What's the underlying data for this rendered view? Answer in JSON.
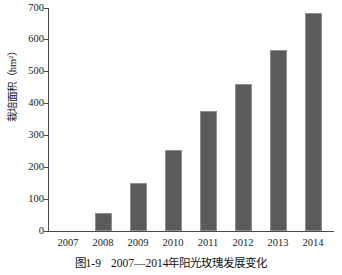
{
  "figure": {
    "caption_number": "图1-9",
    "caption_text": "2007—2014年阳光玫瑰发展变化"
  },
  "chart_data": {
    "type": "bar",
    "title": "",
    "subtitle": "",
    "xlabel": "年",
    "ylabel": "栽培面积（hm²）",
    "categories": [
      "2007",
      "2008",
      "2009",
      "2010",
      "2011",
      "2012",
      "2013",
      "2014"
    ],
    "values": [
      0,
      55,
      152,
      253,
      378,
      462,
      568,
      685
    ],
    "series": [
      {
        "name": "栽培面积",
        "values": [
          0,
          55,
          152,
          253,
          378,
          462,
          568,
          685
        ]
      }
    ],
    "ylim": [
      0,
      700
    ],
    "ytick_labels": [
      "0",
      "100",
      "200",
      "300",
      "400",
      "500",
      "600",
      "700"
    ],
    "ytick_values": [
      0,
      100,
      200,
      300,
      400,
      500,
      600,
      700
    ],
    "xtick_labels": [
      "2007",
      "2008",
      "2009",
      "2010",
      "2011",
      "2012",
      "2013",
      "2014"
    ],
    "grid": false,
    "legend": false,
    "legend_position": "none",
    "bar_color": "#5b5b5b",
    "axis_color": "#4a4a4a",
    "annotations": []
  }
}
